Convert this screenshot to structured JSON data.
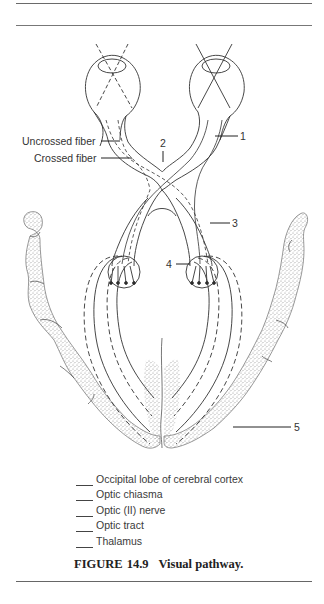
{
  "figure": {
    "label": "FIGURE",
    "number": "14.9",
    "title": "Visual pathway."
  },
  "diagram": {
    "side_labels": {
      "uncrossed_fiber": "Uncrossed fiber",
      "crossed_fiber": "Crossed fiber"
    },
    "numbered_callouts": [
      "1",
      "2",
      "3",
      "4",
      "5"
    ]
  },
  "legend": {
    "items": [
      {
        "blank": "",
        "label": "Occipital lobe of cerebral cortex"
      },
      {
        "blank": "",
        "label": "Optic chiasma"
      },
      {
        "blank": "",
        "label": "Optic (II) nerve"
      },
      {
        "blank": "",
        "label": "Optic tract"
      },
      {
        "blank": "",
        "label": "Thalamus"
      }
    ]
  },
  "colors": {
    "line": "#333333",
    "stipple": "#9a9a9a",
    "rule": "#6a6a6a"
  }
}
